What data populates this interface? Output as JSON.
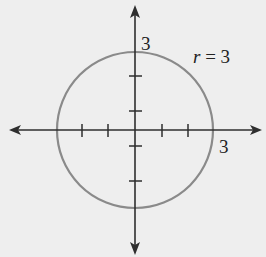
{
  "diagram": {
    "type": "polar-graph",
    "curve_label": "r = 3",
    "curve_label_var": "r",
    "curve_label_rest": " = 3",
    "y_intercept_label": "3",
    "x_intercept_label": "3",
    "colors": {
      "background": "#eeeeee",
      "axes": "#2e2e2e",
      "circle": "#8a8a8a",
      "text": "#222222"
    }
  }
}
